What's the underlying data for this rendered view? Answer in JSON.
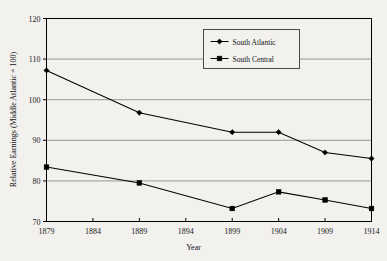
{
  "chart_data": {
    "type": "line",
    "title": "",
    "subtitle": "",
    "xlabel": "Year",
    "ylabel": "Relative Earnings (Middle Atlantic = 100)",
    "x": [
      1879,
      1889,
      1899,
      1904,
      1909,
      1914
    ],
    "xticks": [
      1879,
      1884,
      1889,
      1894,
      1899,
      1904,
      1909,
      1914
    ],
    "xticklabels": [
      "1879",
      "1884",
      "1889",
      "1894",
      "1899",
      "1904",
      "1909",
      "1914"
    ],
    "yticks": [
      70,
      80,
      90,
      100,
      110,
      120
    ],
    "yticklabels": [
      "70",
      "80",
      "90",
      "100",
      "110",
      "120"
    ],
    "xlim": [
      1879,
      1914
    ],
    "ylim": [
      70,
      120
    ],
    "grid": "horizontal",
    "legend_position": "upper-center-right",
    "series": [
      {
        "name": "South Atlantic",
        "marker": "diamond",
        "color": "#000000",
        "values": [
          107.2,
          96.8,
          92.0,
          92.0,
          87.0,
          85.5
        ]
      },
      {
        "name": "South Central",
        "marker": "square",
        "color": "#000000",
        "values": [
          83.4,
          79.5,
          73.2,
          77.3,
          75.3,
          73.2
        ]
      }
    ]
  },
  "figure": {
    "background_color": "#f2f1ee",
    "plot_background_color": "#f2f1ee",
    "axis_color": "#000000",
    "gridline_color": "#808080"
  },
  "legend": {
    "items": [
      {
        "label": "South Atlantic",
        "marker": "diamond-marker-icon"
      },
      {
        "label": "South Central",
        "marker": "square-marker-icon"
      }
    ]
  }
}
